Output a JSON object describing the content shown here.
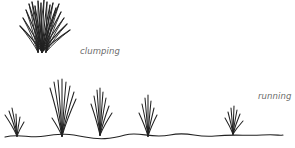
{
  "labels": {
    "clumping": "clumping",
    "running": "running"
  },
  "colors": {
    "stroke": "#222222",
    "label": "#6a6a6a",
    "background": "#ffffff"
  },
  "illustration": {
    "clumping_tuft": {
      "base": [
        42,
        52
      ],
      "blade_tops": [
        [
          20,
          26
        ],
        [
          23,
          18
        ],
        [
          26,
          10
        ],
        [
          29,
          4
        ],
        [
          32,
          2
        ],
        [
          35,
          6
        ],
        [
          38,
          1
        ],
        [
          41,
          3
        ],
        [
          44,
          0
        ],
        [
          47,
          2
        ],
        [
          50,
          5
        ],
        [
          53,
          3
        ],
        [
          56,
          8
        ],
        [
          59,
          4
        ],
        [
          61,
          12
        ],
        [
          64,
          18
        ],
        [
          67,
          24
        ],
        [
          70,
          30
        ]
      ]
    },
    "ground_line": "M5 137 C 20 133, 30 139, 45 136 S 70 134, 85 137 S 110 139, 125 135 S 150 139, 170 135 S 195 138, 215 136 S 245 136, 262 135 S 278 136, 283 135",
    "running_tufts": [
      {
        "base": [
          17,
          136
        ],
        "blade_tops": [
          [
            5,
            115
          ],
          [
            9,
            111
          ],
          [
            12,
            108
          ],
          [
            16,
            114
          ],
          [
            20,
            117
          ],
          [
            24,
            122
          ]
        ]
      },
      {
        "base": [
          62,
          136
        ],
        "blade_tops": [
          [
            50,
            88
          ],
          [
            54,
            82
          ],
          [
            58,
            80
          ],
          [
            62,
            79
          ],
          [
            66,
            82
          ],
          [
            70,
            86
          ],
          [
            74,
            92
          ],
          [
            76,
            99
          ],
          [
            52,
            118
          ]
        ]
      },
      {
        "base": [
          100,
          135
        ],
        "blade_tops": [
          [
            91,
            104
          ],
          [
            94,
            96
          ],
          [
            97,
            90
          ],
          [
            100,
            88
          ],
          [
            103,
            92
          ],
          [
            106,
            98
          ],
          [
            109,
            106
          ],
          [
            112,
            113
          ]
        ]
      },
      {
        "base": [
          148,
          136
        ],
        "blade_tops": [
          [
            139,
            113
          ],
          [
            142,
            104
          ],
          [
            145,
            98
          ],
          [
            148,
            95
          ],
          [
            151,
            101
          ],
          [
            154,
            108
          ],
          [
            157,
            115
          ]
        ]
      },
      {
        "base": [
          233,
          134
        ],
        "blade_tops": [
          [
            225,
            118
          ],
          [
            228,
            112
          ],
          [
            231,
            108
          ],
          [
            234,
            106
          ],
          [
            237,
            110
          ],
          [
            240,
            114
          ],
          [
            243,
            121
          ]
        ]
      }
    ]
  }
}
